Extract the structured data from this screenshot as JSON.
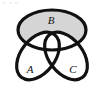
{
  "figure": {
    "type": "venn-diagram",
    "width": 104,
    "height": 92,
    "background_color": "#ffffff",
    "stroke_color": "#111111",
    "stroke_width": 3.2,
    "shaded_fill_color": "#d5d5d5",
    "unshaded_fill_color": "#ffffff",
    "shaded_region_description": "B only (B minus A and minus C)"
  },
  "sets": [
    {
      "id": "A",
      "label": "A",
      "label_x": 30,
      "label_y": 73,
      "font_size": 11,
      "shape": "ellipse",
      "cx": 38,
      "cy": 56,
      "rx": 27,
      "ry": 17,
      "rotation": -52,
      "filled": false
    },
    {
      "id": "B",
      "label": "B",
      "label_x": 51,
      "label_y": 24,
      "font_size": 11,
      "shape": "ellipse",
      "cx": 52,
      "cy": 30,
      "rx": 34,
      "ry": 20,
      "rotation": 0,
      "filled": true
    },
    {
      "id": "C",
      "label": "C",
      "label_x": 73,
      "label_y": 73,
      "font_size": 11,
      "shape": "ellipse",
      "cx": 66,
      "cy": 56,
      "rx": 27,
      "ry": 17,
      "rotation": 52,
      "filled": false
    }
  ],
  "noise_marks": [
    {
      "x": 3,
      "y": 2,
      "w": 3,
      "h": 2
    },
    {
      "x": 9,
      "y": 2,
      "w": 3,
      "h": 2
    },
    {
      "x": 15,
      "y": 2,
      "w": 3,
      "h": 2
    }
  ]
}
